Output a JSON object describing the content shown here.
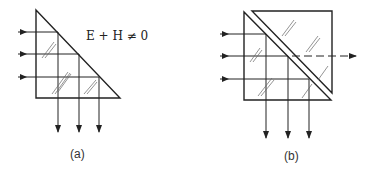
{
  "figure_a": {
    "equation": "E + H ≠ 0",
    "caption": "(a)",
    "description": "Right-angle prism with three incident horizontal rays totally internally reflected downward"
  },
  "figure_b": {
    "caption": "(b)",
    "description": "Two prisms forming a cube with a small gap; frustrated total internal reflection — partial transmission shown dashed"
  },
  "colors": {
    "stroke": "#222222",
    "hatch": "#555555",
    "background": "#ffffff"
  }
}
